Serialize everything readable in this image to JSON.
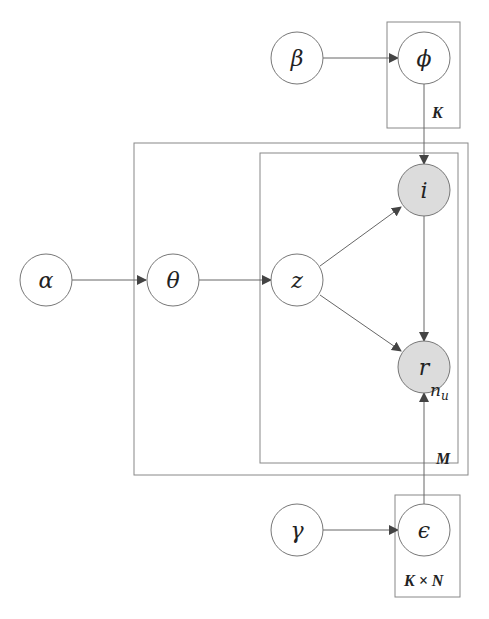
{
  "diagram": {
    "type": "plate-notation graphical model",
    "nodes": [
      {
        "id": "alpha",
        "label": "α",
        "observed": false
      },
      {
        "id": "theta",
        "label": "θ",
        "observed": false
      },
      {
        "id": "z",
        "label": "z",
        "observed": false
      },
      {
        "id": "i",
        "label": "i",
        "observed": true
      },
      {
        "id": "r",
        "label": "r",
        "observed": true
      },
      {
        "id": "beta",
        "label": "β",
        "observed": false
      },
      {
        "id": "phi",
        "label": "ϕ",
        "observed": false
      },
      {
        "id": "gamma",
        "label": "γ",
        "observed": false
      },
      {
        "id": "epsilon",
        "label": "ϵ",
        "observed": false
      }
    ],
    "edges": [
      {
        "from": "alpha",
        "to": "theta"
      },
      {
        "from": "theta",
        "to": "z"
      },
      {
        "from": "z",
        "to": "i"
      },
      {
        "from": "z",
        "to": "r"
      },
      {
        "from": "i",
        "to": "r"
      },
      {
        "from": "beta",
        "to": "phi"
      },
      {
        "from": "phi",
        "to": "i"
      },
      {
        "from": "gamma",
        "to": "epsilon"
      },
      {
        "from": "epsilon",
        "to": "r"
      }
    ],
    "plates": [
      {
        "id": "plate-k",
        "label": "K"
      },
      {
        "id": "plate-m",
        "label": "M"
      },
      {
        "id": "plate-nu",
        "label": "n",
        "sub": "u"
      },
      {
        "id": "plate-kxn",
        "label": "K × N"
      }
    ],
    "colors": {
      "observed_fill": "#dcdcdc",
      "stroke": "#777777",
      "arrow": "#444444"
    }
  }
}
